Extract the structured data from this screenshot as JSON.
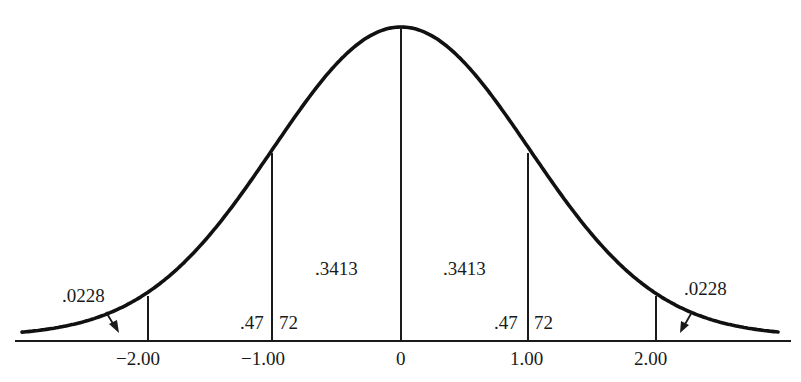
{
  "chart_data": {
    "type": "area",
    "title": "",
    "xlabel": "",
    "ylabel": "",
    "x_ticks": [
      "−2.00",
      "−1.00",
      "0",
      "1.00",
      "2.00"
    ],
    "x_values": [
      -2.0,
      -1.0,
      0,
      1.0,
      2.0
    ],
    "regions": [
      {
        "from": "-inf",
        "to": -2.0,
        "area": ".0228",
        "side": "left-tail"
      },
      {
        "from": -1.0,
        "to": 0,
        "area": ".3413"
      },
      {
        "from": 0,
        "to": 1.0,
        "area": ".3413"
      },
      {
        "from": 2.0,
        "to": "inf",
        "area": ".0228",
        "side": "right-tail"
      }
    ],
    "split_labels": [
      {
        "at": -1.0,
        "left": ".47",
        "right": "72",
        "meaning": "area between -2.00 and 0 = .4772"
      },
      {
        "at": 1.0,
        "left": ".47",
        "right": "72",
        "meaning": "area between 0 and 2.00 = .4772"
      }
    ],
    "grid": false,
    "legend": null
  },
  "labels": {
    "tail_left": ".0228",
    "tail_right": ".0228",
    "area_left_center": ".3413",
    "area_right_center": ".3413",
    "split_left_a": ".47",
    "split_left_b": "72",
    "split_right_a": ".47",
    "split_right_b": "72"
  },
  "ticks": {
    "neg2": "−2.00",
    "neg1": "−1.00",
    "zero": "0",
    "pos1": "1.00",
    "pos2": "2.00"
  }
}
